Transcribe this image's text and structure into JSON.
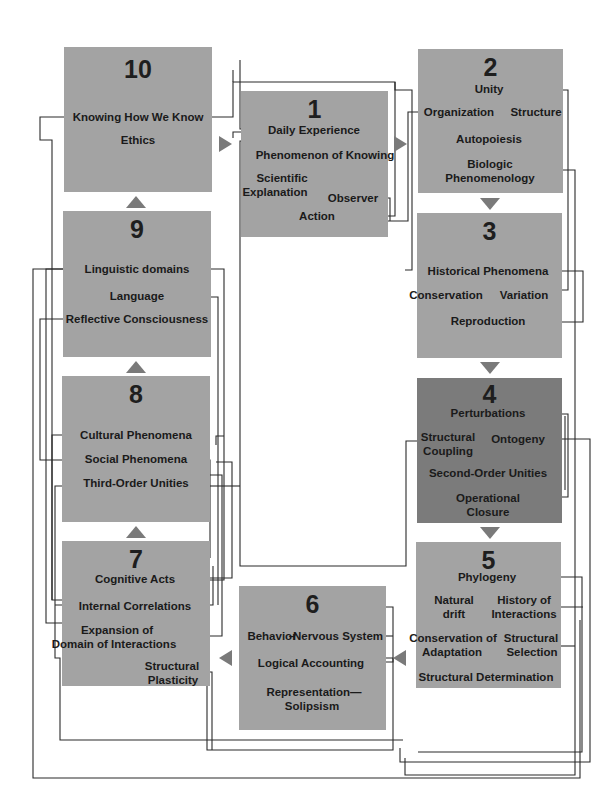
{
  "diagram": {
    "colors": {
      "box": "#a3a3a3",
      "box_highlight": "#7b7b7b",
      "arrow": "#7a7a7a",
      "line": "#2a2a2a"
    },
    "boxes": [
      {
        "id": "1",
        "number": "1",
        "concepts": [
          "Daily Experience",
          "Phenomenon of Knowing",
          "Scientific",
          "Explanation",
          "Observer",
          "Action"
        ]
      },
      {
        "id": "2",
        "number": "2",
        "concepts": [
          "Unity",
          "Organization",
          "Structure",
          "Autopoiesis",
          "Biologic",
          "Phenomenology"
        ]
      },
      {
        "id": "3",
        "number": "3",
        "concepts": [
          "Historical Phenomena",
          "Conservation",
          "Variation",
          "Reproduction"
        ]
      },
      {
        "id": "4",
        "number": "4",
        "highlighted": true,
        "concepts": [
          "Perturbations",
          "Structural",
          "Coupling",
          "Ontogeny",
          "Second-Order Unities",
          "Operational",
          "Closure"
        ]
      },
      {
        "id": "5",
        "number": "5",
        "concepts": [
          "Phylogeny",
          "Natural",
          "drift",
          "History of",
          "Interactions",
          "Conservation of",
          "Adaptation",
          "Structural",
          "Selection",
          "Structural Determination"
        ]
      },
      {
        "id": "6",
        "number": "6",
        "concepts": [
          "Behavior",
          "–",
          "Nervous System",
          "Logical Accounting",
          "Representation—",
          "Solipsism"
        ]
      },
      {
        "id": "7",
        "number": "7",
        "concepts": [
          "Cognitive Acts",
          "Internal Correlations",
          "Expansion of",
          "Domain of Interactions",
          "Structural",
          "Plasticity"
        ]
      },
      {
        "id": "8",
        "number": "8",
        "concepts": [
          "Cultural Phenomena",
          "Social Phenomena",
          "Third-Order Unities"
        ]
      },
      {
        "id": "9",
        "number": "9",
        "concepts": [
          "Linguistic domains",
          "Language",
          "Reflective Consciousness"
        ]
      },
      {
        "id": "10",
        "number": "10",
        "concepts": [
          "Knowing How We Know",
          "Ethics"
        ]
      }
    ],
    "flow": [
      "1",
      "2",
      "3",
      "4",
      "5",
      "6",
      "7",
      "8",
      "9",
      "10",
      "1"
    ]
  }
}
